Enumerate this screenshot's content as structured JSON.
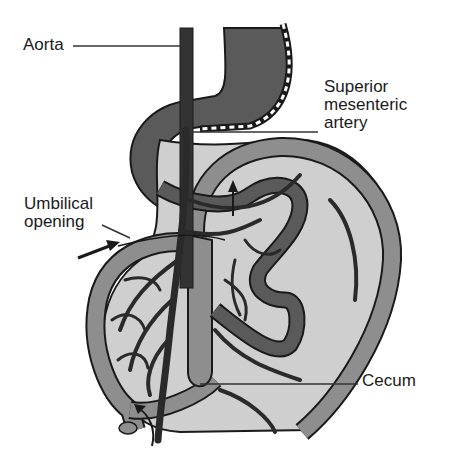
{
  "diagram": {
    "labels": {
      "aorta": "Aorta",
      "superior_mesenteric_artery": "Superior\nmesenteric\nartery",
      "umbilical_opening": "Umbilical\nopening",
      "cecum": "Cecum"
    },
    "colors": {
      "background": "#ffffff",
      "outline": "#1a1a1a",
      "dark_gut": "#5a5a5a",
      "medium_gut": "#8e8e8e",
      "light_mesentery": "#cfcfcf",
      "vessel": "#2a2a2a",
      "leader_line": "#333333"
    },
    "arrows": [
      {
        "name": "umbilical-arrow",
        "direction": "right"
      },
      {
        "name": "rotation-arrow-upper",
        "direction": "up"
      },
      {
        "name": "rotation-arrow-lower",
        "direction": "up"
      }
    ]
  }
}
